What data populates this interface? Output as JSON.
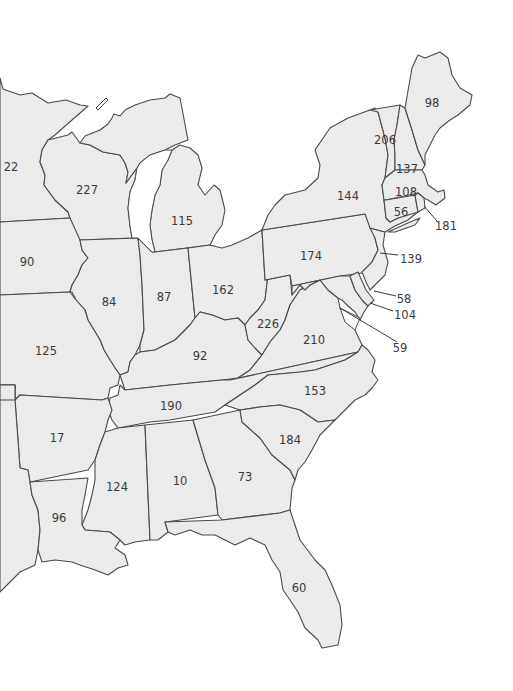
{
  "map": {
    "region": "Eastern United States",
    "colors": {
      "fill": "#ebebeb",
      "stroke": "#4a4a4a",
      "text": "#3a3a3a",
      "background": "#ffffff"
    },
    "states": [
      {
        "id": "MN",
        "value": "22",
        "x": 11,
        "y": 167
      },
      {
        "id": "WI",
        "value": "227",
        "x": 87,
        "y": 190
      },
      {
        "id": "MI",
        "value": "115",
        "x": 182,
        "y": 221
      },
      {
        "id": "IA",
        "value": "90",
        "x": 27,
        "y": 262
      },
      {
        "id": "IL",
        "value": "84",
        "x": 109,
        "y": 302
      },
      {
        "id": "IN",
        "value": "87",
        "x": 164,
        "y": 297
      },
      {
        "id": "OH",
        "value": "162",
        "x": 223,
        "y": 290
      },
      {
        "id": "MO",
        "value": "125",
        "x": 46,
        "y": 351
      },
      {
        "id": "KY",
        "value": "92",
        "x": 200,
        "y": 356
      },
      {
        "id": "WV",
        "value": "226",
        "x": 268,
        "y": 324
      },
      {
        "id": "VA",
        "value": "210",
        "x": 314,
        "y": 340
      },
      {
        "id": "PA",
        "value": "174",
        "x": 311,
        "y": 256
      },
      {
        "id": "NY",
        "value": "144",
        "x": 348,
        "y": 196
      },
      {
        "id": "ME",
        "value": "98",
        "x": 432,
        "y": 103
      },
      {
        "id": "VT",
        "value": "206",
        "x": 385,
        "y": 140
      },
      {
        "id": "NH",
        "value": "137",
        "x": 407,
        "y": 169
      },
      {
        "id": "MA",
        "value": "108",
        "x": 406,
        "y": 192
      },
      {
        "id": "CT",
        "value": "56",
        "x": 401,
        "y": 212
      },
      {
        "id": "RI",
        "value": "181",
        "x": 446,
        "y": 226,
        "leader": [
          424,
          206,
          437,
          221
        ]
      },
      {
        "id": "NJ",
        "value": "139",
        "x": 411,
        "y": 259,
        "leader": [
          380,
          253,
          398,
          255
        ]
      },
      {
        "id": "DE",
        "value": "58",
        "x": 404,
        "y": 299,
        "leader": [
          374,
          291,
          396,
          296
        ]
      },
      {
        "id": "MD",
        "value": "104",
        "x": 405,
        "y": 315,
        "leader": [
          370,
          303,
          393,
          311
        ]
      },
      {
        "id": "DC",
        "value": "59",
        "x": 400,
        "y": 348,
        "leader": [
          340,
          308,
          397,
          342
        ]
      },
      {
        "id": "TN",
        "value": "190",
        "x": 171,
        "y": 406
      },
      {
        "id": "NC",
        "value": "153",
        "x": 315,
        "y": 391
      },
      {
        "id": "AR",
        "value": "17",
        "x": 57,
        "y": 438
      },
      {
        "id": "SC",
        "value": "184",
        "x": 290,
        "y": 440
      },
      {
        "id": "MS",
        "value": "124",
        "x": 117,
        "y": 487
      },
      {
        "id": "AL",
        "value": "10",
        "x": 180,
        "y": 481
      },
      {
        "id": "GA",
        "value": "73",
        "x": 245,
        "y": 477
      },
      {
        "id": "LA",
        "value": "96",
        "x": 59,
        "y": 518
      },
      {
        "id": "FL",
        "value": "60",
        "x": 299,
        "y": 588
      }
    ]
  }
}
